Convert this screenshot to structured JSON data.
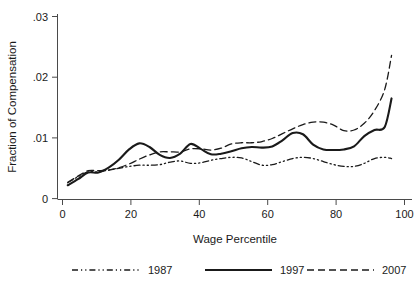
{
  "chart_data": {
    "type": "line",
    "title": "",
    "xlabel": "Wage Percentile",
    "ylabel": "Fraction of Compensation",
    "xlim": [
      0,
      104
    ],
    "ylim": [
      0,
      0.03
    ],
    "xticks": [
      "0",
      "20",
      "40",
      "60",
      "80",
      "100"
    ],
    "xtick_values": [
      0,
      20,
      40,
      60,
      80,
      100
    ],
    "yticks": [
      ".03",
      ".02",
      ".01",
      "0"
    ],
    "ytick_values": [
      0.03,
      0.02,
      0.01,
      0
    ],
    "grid": false,
    "legend_position": "bottom",
    "x": [
      3,
      6,
      9,
      12,
      15,
      18,
      21,
      24,
      27,
      30,
      33,
      36,
      39,
      42,
      45,
      48,
      51,
      54,
      57,
      60,
      63,
      66,
      69,
      72,
      75,
      78,
      81,
      84,
      87,
      90,
      93,
      96,
      98
    ],
    "series": [
      {
        "name": "1987",
        "style": "dash-dot-dot",
        "color": "#1a1a1a",
        "values": [
          0.0026,
          0.0036,
          0.0044,
          0.0044,
          0.0047,
          0.005,
          0.0053,
          0.0055,
          0.0055,
          0.0056,
          0.006,
          0.0062,
          0.0058,
          0.0059,
          0.0063,
          0.0066,
          0.0068,
          0.0067,
          0.0061,
          0.0055,
          0.0056,
          0.0061,
          0.0066,
          0.0068,
          0.0066,
          0.0061,
          0.0056,
          0.0053,
          0.0053,
          0.0058,
          0.0066,
          0.0068,
          0.0066
        ]
      },
      {
        "name": "1997",
        "style": "solid",
        "color": "#1a1a1a",
        "values": [
          0.0022,
          0.0032,
          0.0043,
          0.0043,
          0.0051,
          0.0064,
          0.0081,
          0.0091,
          0.0085,
          0.0072,
          0.0067,
          0.0074,
          0.009,
          0.0082,
          0.0073,
          0.0074,
          0.0078,
          0.0083,
          0.0085,
          0.0084,
          0.0086,
          0.0096,
          0.0108,
          0.0106,
          0.0089,
          0.0081,
          0.008,
          0.0081,
          0.0086,
          0.0103,
          0.0113,
          0.0118,
          0.0165
        ]
      },
      {
        "name": "2007",
        "style": "dashed",
        "color": "#1a1a1a",
        "values": [
          0.0027,
          0.0037,
          0.0046,
          0.0046,
          0.0047,
          0.0051,
          0.0057,
          0.0065,
          0.0072,
          0.0077,
          0.0077,
          0.0077,
          0.0082,
          0.0082,
          0.008,
          0.0083,
          0.009,
          0.0092,
          0.0092,
          0.0094,
          0.0099,
          0.0107,
          0.0115,
          0.0122,
          0.0126,
          0.0126,
          0.0121,
          0.0112,
          0.0113,
          0.0124,
          0.0145,
          0.018,
          0.0236
        ]
      }
    ],
    "legend": [
      {
        "label": "1987",
        "style": "dash-dot-dot"
      },
      {
        "label": "1997",
        "style": "solid"
      },
      {
        "label": "2007",
        "style": "dashed"
      }
    ]
  },
  "axes": {
    "x_title": "Wage Percentile",
    "y_title": "Fraction of Compensation"
  }
}
